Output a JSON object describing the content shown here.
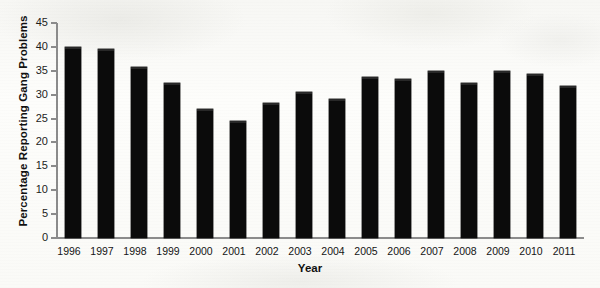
{
  "chart_data": {
    "type": "bar",
    "title": "",
    "xlabel": "Year",
    "ylabel": "Percentage Reporting Gang Problems",
    "categories": [
      "1996",
      "1997",
      "1998",
      "1999",
      "2000",
      "2001",
      "2002",
      "2003",
      "2004",
      "2005",
      "2006",
      "2007",
      "2008",
      "2009",
      "2010",
      "2011"
    ],
    "values": [
      40.0,
      39.5,
      35.8,
      32.5,
      27.0,
      24.5,
      28.2,
      30.5,
      29.2,
      33.7,
      33.3,
      35.0,
      32.5,
      35.0,
      34.3,
      31.8
    ],
    "ylim": [
      0,
      45
    ],
    "y_ticks": [
      "0",
      "5",
      "10",
      "15",
      "20",
      "25",
      "30",
      "35",
      "40",
      "45"
    ],
    "grid": false,
    "legend": "none",
    "bar_color": "#0b0b0b",
    "axis_color": "#8b8b8b",
    "background_color": "#fbfbf9"
  }
}
